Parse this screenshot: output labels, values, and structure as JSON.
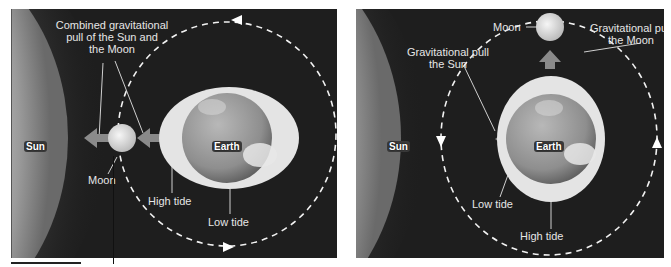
{
  "figure": {
    "left_panel": {
      "sun_label": "Sun",
      "earth_label": "Earth",
      "moon_label": "Moon",
      "combined_pull_label_line1": "Combined gravitational",
      "combined_pull_label_line2": "pull of the Sun and",
      "combined_pull_label_line3": "the Moon",
      "high_tide_label": "High tide",
      "low_tide_label": "Low tide"
    },
    "right_panel": {
      "sun_label": "Sun",
      "earth_label": "Earth",
      "moon_label": "Moon",
      "sun_pull_label_line1": "Gravitational pull",
      "sun_pull_label_line2": "the Sun",
      "moon_pull_label_line1": "Gravitational pull",
      "moon_pull_label_line2": "the Moon",
      "low_tide_label": "Low tide",
      "high_tide_label": "High tide"
    },
    "colors": {
      "background": "#1e1e1e",
      "tide_bulge": "#e4e4e4",
      "arrow": "#8a8a8a",
      "orbit": "#f2f2f2",
      "label_text": "#e6e6e6"
    }
  }
}
